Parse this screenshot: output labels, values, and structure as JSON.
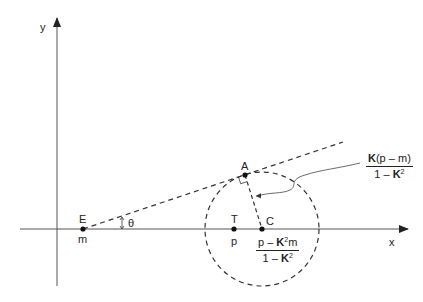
{
  "axes": {
    "x_label": "x",
    "y_label": "y"
  },
  "points": {
    "E": {
      "label": "E",
      "sublabel": "m"
    },
    "A": {
      "label": "A"
    },
    "T": {
      "label": "T",
      "sublabel": "p"
    },
    "C": {
      "label": "C"
    }
  },
  "angle_label": "θ",
  "center_formula": {
    "num_a": "p – ",
    "num_k": "K",
    "num_exp": "2",
    "num_b": "m",
    "den_a": "1 – ",
    "den_k": "K",
    "den_exp": "2"
  },
  "radius_formula": {
    "num_k": "K",
    "num_b": "(p – m)",
    "den_a": "1 – ",
    "den_k": "K",
    "den_exp": "2"
  },
  "colors": {
    "stroke": "#333333",
    "text": "#222222"
  }
}
